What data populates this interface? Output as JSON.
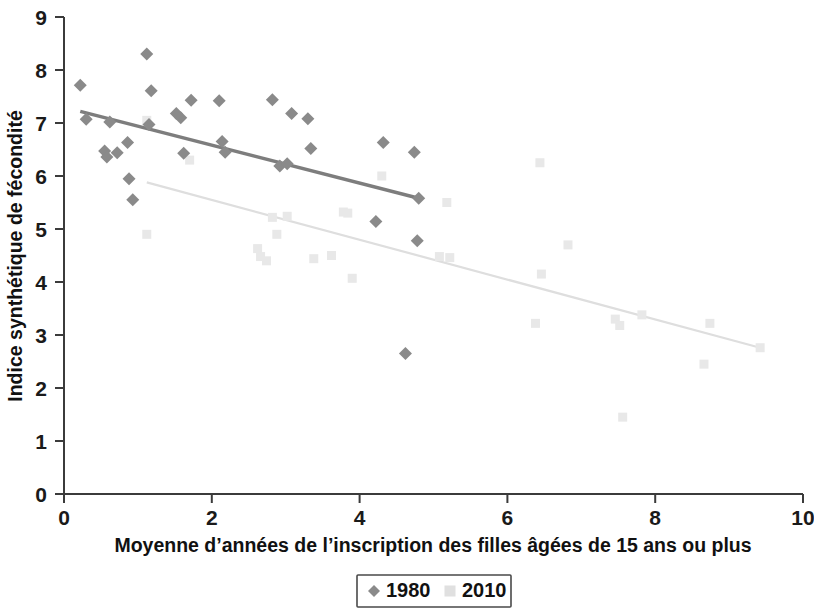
{
  "chart_data": {
    "type": "scatter",
    "title": "",
    "xlabel": "Moyenne d’années de l’inscription des filles âgées de 15 ans ou plus",
    "ylabel": "Indice synthétique de fécondité",
    "xlim": [
      0,
      10
    ],
    "ylim": [
      0,
      9
    ],
    "xticks": [
      "0",
      "2",
      "4",
      "6",
      "8",
      "10"
    ],
    "xtick_values": [
      0,
      2,
      4,
      6,
      8,
      10
    ],
    "yticks": [
      "0",
      "1",
      "2",
      "3",
      "4",
      "5",
      "6",
      "7",
      "8",
      "9"
    ],
    "ytick_values": [
      0,
      1,
      2,
      3,
      4,
      5,
      6,
      7,
      8,
      9
    ],
    "grid": false,
    "legend_position": "bottom",
    "series": [
      {
        "name": "1980",
        "marker": "diamond",
        "color": "#8a8a8a",
        "points": [
          [
            0.22,
            7.71
          ],
          [
            0.3,
            7.07
          ],
          [
            0.55,
            6.47
          ],
          [
            0.58,
            6.36
          ],
          [
            0.62,
            7.02
          ],
          [
            0.72,
            6.44
          ],
          [
            0.86,
            6.63
          ],
          [
            0.88,
            5.95
          ],
          [
            0.93,
            5.55
          ],
          [
            1.12,
            8.3
          ],
          [
            1.15,
            6.97
          ],
          [
            1.18,
            7.61
          ],
          [
            1.52,
            7.18
          ],
          [
            1.58,
            7.1
          ],
          [
            1.62,
            6.43
          ],
          [
            1.72,
            7.43
          ],
          [
            2.1,
            7.42
          ],
          [
            2.14,
            6.65
          ],
          [
            2.18,
            6.45
          ],
          [
            2.82,
            7.44
          ],
          [
            2.92,
            6.19
          ],
          [
            3.02,
            6.23
          ],
          [
            3.08,
            7.18
          ],
          [
            3.3,
            7.08
          ],
          [
            3.34,
            6.52
          ],
          [
            4.22,
            5.14
          ],
          [
            4.32,
            6.63
          ],
          [
            4.62,
            2.65
          ],
          [
            4.74,
            6.45
          ],
          [
            4.78,
            4.78
          ],
          [
            4.8,
            5.58
          ]
        ],
        "trendline": {
          "x1": 0.22,
          "y1": 7.22,
          "x2": 4.8,
          "y2": 5.58
        }
      },
      {
        "name": "2010",
        "marker": "square",
        "color": "#e8e8e8",
        "points": [
          [
            1.12,
            7.05
          ],
          [
            1.12,
            4.9
          ],
          [
            1.7,
            6.3
          ],
          [
            2.62,
            4.63
          ],
          [
            2.66,
            4.48
          ],
          [
            2.74,
            4.4
          ],
          [
            2.82,
            5.22
          ],
          [
            2.88,
            4.9
          ],
          [
            3.02,
            5.24
          ],
          [
            3.38,
            4.44
          ],
          [
            3.62,
            4.5
          ],
          [
            3.78,
            5.32
          ],
          [
            3.84,
            5.3
          ],
          [
            3.9,
            4.07
          ],
          [
            4.3,
            6.0
          ],
          [
            5.08,
            4.48
          ],
          [
            5.18,
            5.5
          ],
          [
            5.22,
            4.46
          ],
          [
            6.38,
            3.22
          ],
          [
            6.44,
            6.25
          ],
          [
            6.46,
            4.15
          ],
          [
            6.82,
            4.7
          ],
          [
            7.46,
            3.3
          ],
          [
            7.52,
            3.18
          ],
          [
            7.56,
            1.45
          ],
          [
            7.82,
            3.38
          ],
          [
            8.66,
            2.45
          ],
          [
            8.74,
            3.22
          ],
          [
            9.42,
            2.76
          ]
        ],
        "trendline": {
          "x1": 1.12,
          "y1": 5.88,
          "x2": 9.42,
          "y2": 2.76
        }
      }
    ]
  },
  "legend": {
    "entries": [
      {
        "label": "1980",
        "marker": "diamond",
        "color": "#8a8a8a"
      },
      {
        "label": "2010",
        "marker": "square",
        "color": "#e0e0e0"
      }
    ]
  }
}
